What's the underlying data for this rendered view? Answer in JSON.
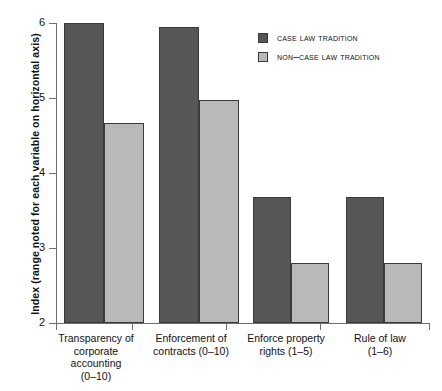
{
  "chart_data": {
    "type": "bar",
    "title": "",
    "xlabel": "",
    "ylabel": "Index (range noted for each variable on horizontal axis)",
    "ylim": [
      2,
      6
    ],
    "yticks": [
      "2",
      "3",
      "4",
      "5",
      "6"
    ],
    "grid": false,
    "legend_position": "top-right",
    "categories": [
      "Transparency of corporate accounting (0–10)",
      "Enforcement of contracts (0–10)",
      "Enforce property rights (1–5)",
      "Rule of law (1–6)"
    ],
    "category_lines": [
      [
        "Transparency of",
        "corporate",
        "accounting",
        "(0–10)"
      ],
      [
        "Enforcement of",
        "contracts (0–10)"
      ],
      [
        "Enforce property",
        "rights (1–5)"
      ],
      [
        "Rule of law",
        "(1–6)"
      ]
    ],
    "series": [
      {
        "name": "Case law tradition",
        "color": "#565656",
        "values": [
          6.0,
          5.95,
          3.68,
          3.68
        ]
      },
      {
        "name": "Non–case law tradition",
        "color": "#b9b9b9",
        "values": [
          4.67,
          4.98,
          2.8,
          2.8
        ]
      }
    ]
  },
  "legend": {
    "items": [
      {
        "label": "Case law tradition"
      },
      {
        "label": "Non–case law tradition"
      }
    ]
  },
  "axis": {
    "y_title": "Index (range noted for each variable on horizontal axis)",
    "y_tick_labels": [
      "6",
      "5",
      "4",
      "3",
      "2"
    ]
  }
}
